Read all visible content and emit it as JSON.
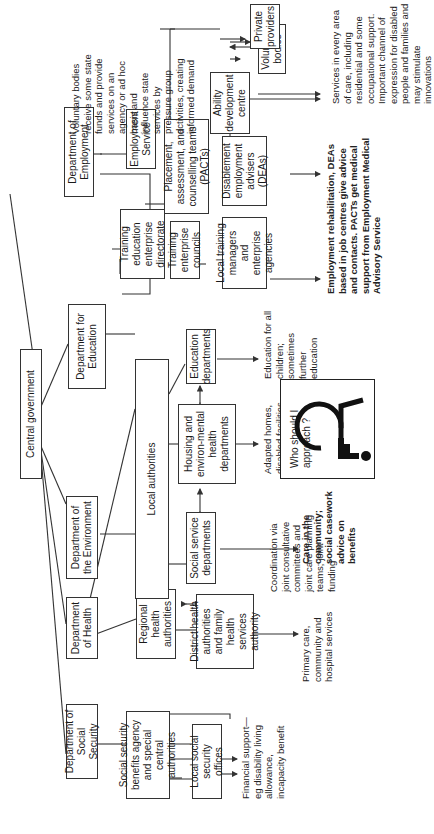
{
  "diagram": {
    "root": {
      "label": "Central government"
    },
    "departments": [
      {
        "id": "dss",
        "label": "Department of Social Security"
      },
      {
        "id": "doh",
        "label": "Department of Health"
      },
      {
        "id": "doe",
        "label": "Department of the Environment"
      },
      {
        "id": "dfe",
        "label": "Department for Education"
      },
      {
        "id": "dept_employment",
        "label": "Department of Employment"
      }
    ],
    "agencies": {
      "ssba": "Social security benefits agency and special central authorities",
      "local_ss_offices": "Local social security offices",
      "regional_health": "Regional health authorities",
      "district_health": "District health authorities and family health services authority",
      "local_authorities": "Local authorities",
      "social_service": "Social service departments",
      "housing": "Housing and environ-mental health departments",
      "education_depts": "Education departments",
      "teed": "Training education enterprise directorate",
      "employment_service": "Employment Service",
      "tecs": "Training enterprise councils",
      "pacts": "Placement, assessment, and counselling teams (PACTs)",
      "local_training": "Local training managers and enterprise agencies",
      "deas": "Disablement employment advisers (DEAs)",
      "ability_centre": "Ability development centre",
      "voluntary_bodies": "Voluntary bodies",
      "private_providers": "Private providers"
    },
    "outcomes": {
      "financial": "Financial support—eg disability living allowance, incapacity benefit",
      "health": "Primary care, community and hospital services",
      "coordination": "Coordination via joint consultative committees and joint care planning teams; joint funding",
      "social_care": "Care in the community; social casework advice on benefits",
      "housing": "Adapted homes, disabled facilities grants, housing benefit",
      "education": "Education for all children; sometimes further education",
      "employment": "Employment rehabilitation, DEAs based in job centres give advice and contacts. PACTs get medical support from Employment Medical Advisory Service",
      "voluntary_services": "Services in every area of care, including residential and some occupational support. Important channel of expression for disabled people and families and may stimulate innovations",
      "voluntary_note": "Voluntary bodies receive some state funds and provide services on an agency or ad hoc basis and influence state services by pressure group activities, creating informed demand"
    },
    "callout": {
      "question": "Who should I approach ?",
      "icon": "wheelchair-icon"
    }
  }
}
